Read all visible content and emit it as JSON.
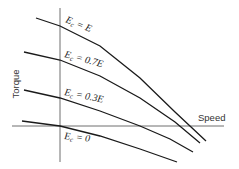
{
  "diagram": {
    "x_axis_label": "Speed",
    "y_axis_label": "Torque",
    "curves": [
      {
        "id": "E",
        "label_main": "E",
        "label_sub": "c",
        "label_rest": " = E",
        "points": "36,18 60,26 100,46 140,78 175,112 206,141"
      },
      {
        "id": "0.7E",
        "label_main": "E",
        "label_sub": "c",
        "label_rest": " = 0.7E",
        "points": "24,52 60,60 100,76 140,98 175,122 200,143"
      },
      {
        "id": "0.3E",
        "label_main": "E",
        "label_sub": "c",
        "label_rest": " = 0.3E",
        "points": "24,90 60,98 100,111 140,126 170,139 193,152"
      },
      {
        "id": "0",
        "label_main": "E",
        "label_sub": "c",
        "label_rest": " = 0",
        "points": "22,121 60,126 100,136 140,149 177,162"
      }
    ]
  }
}
